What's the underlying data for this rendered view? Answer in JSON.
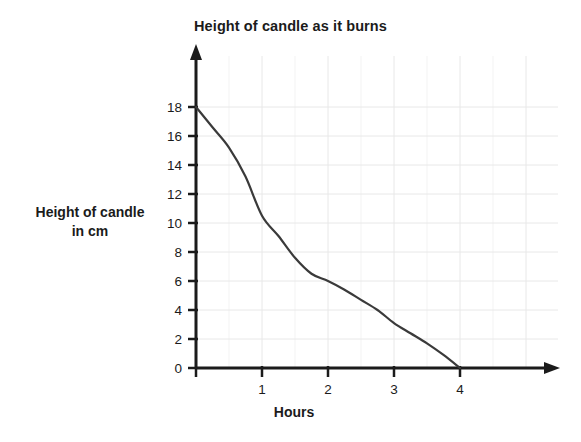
{
  "chart_data": {
    "type": "line",
    "title": "Height of candle as it burns",
    "xlabel": "Hours",
    "ylabel": "Height of candle in cm",
    "ylabel_line1": "Height of candle",
    "ylabel_line2": "in cm",
    "xlim": [
      0,
      4.9
    ],
    "ylim": [
      0,
      19
    ],
    "xticks": [
      1,
      2,
      3,
      4
    ],
    "xtick_labels": [
      "1",
      "2",
      "3",
      "4"
    ],
    "yticks": [
      0,
      2,
      4,
      6,
      8,
      10,
      12,
      14,
      16,
      18
    ],
    "ytick_labels": [
      "0",
      "2",
      "4",
      "6",
      "8",
      "10",
      "12",
      "14",
      "16",
      "18"
    ],
    "grid": true,
    "grid_x_step": 0.5,
    "grid_y_step": 2,
    "legend": "none",
    "series": [
      {
        "name": "Candle height",
        "x": [
          0,
          0.25,
          0.5,
          0.75,
          1.0,
          1.25,
          1.5,
          1.75,
          2.0,
          2.25,
          2.5,
          2.75,
          3.0,
          3.25,
          3.5,
          3.75,
          4.0
        ],
        "values": [
          18.0,
          16.6,
          15.2,
          13.2,
          10.5,
          9.1,
          7.6,
          6.5,
          6.0,
          5.4,
          4.7,
          4.0,
          3.1,
          2.4,
          1.7,
          0.9,
          0.0
        ]
      }
    ],
    "line_color": "#3a3a3a",
    "grid_color": "#e8e8e8",
    "axis_color": "#1b1b1b",
    "background": "#ffffff"
  }
}
